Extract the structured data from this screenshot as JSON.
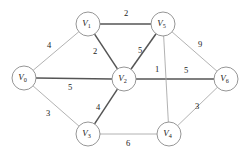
{
  "figure": {
    "background_color": "#ffffff",
    "edge_color": "#a9a9a9",
    "edge_highlight_color": "#555555",
    "node_fill": "#ffffff",
    "node_stroke": "#8a8a8a",
    "text_color": "#1a1a1a"
  },
  "chart_data": {
    "type": "diagram",
    "subtype": "weighted-undirected-graph",
    "title": "",
    "nodes": [
      {
        "id": "V0",
        "label": "V",
        "sub": "0",
        "x": 24,
        "y": 78
      },
      {
        "id": "V1",
        "label": "V",
        "sub": "1",
        "x": 88,
        "y": 24
      },
      {
        "id": "V5",
        "label": "V",
        "sub": "5",
        "x": 163,
        "y": 24
      },
      {
        "id": "V2",
        "label": "V",
        "sub": "2",
        "x": 124,
        "y": 79
      },
      {
        "id": "V6",
        "label": "V",
        "sub": "6",
        "x": 226,
        "y": 79
      },
      {
        "id": "V3",
        "label": "V",
        "sub": "3",
        "x": 88,
        "y": 134
      },
      {
        "id": "V4",
        "label": "V",
        "sub": "4",
        "x": 169,
        "y": 134
      }
    ],
    "node_radius": 12,
    "edges": [
      {
        "from": "V0",
        "to": "V1",
        "weight": "4",
        "lx": 49,
        "ly": 46,
        "bold": false
      },
      {
        "from": "V1",
        "to": "V5",
        "weight": "2",
        "lx": 126,
        "ly": 14,
        "bold": true
      },
      {
        "from": "V1",
        "to": "V2",
        "weight": "2",
        "lx": 95,
        "ly": 52,
        "bold": true
      },
      {
        "from": "V2",
        "to": "V5",
        "weight": "5",
        "lx": 140,
        "ly": 51,
        "bold": true
      },
      {
        "from": "V5",
        "to": "V6",
        "weight": "9",
        "lx": 200,
        "ly": 45,
        "bold": false
      },
      {
        "from": "V0",
        "to": "V2",
        "weight": "5",
        "lx": 70,
        "ly": 88,
        "bold": true
      },
      {
        "from": "V2",
        "to": "V6",
        "weight": "5",
        "lx": 186,
        "ly": 71,
        "bold": true
      },
      {
        "from": "V5",
        "to": "V4",
        "weight": "1",
        "lx": 157,
        "ly": 70,
        "bold": false
      },
      {
        "from": "V0",
        "to": "V3",
        "weight": "3",
        "lx": 48,
        "ly": 114,
        "bold": false
      },
      {
        "from": "V2",
        "to": "V3",
        "weight": "4",
        "lx": 98,
        "ly": 108,
        "bold": true
      },
      {
        "from": "V3",
        "to": "V4",
        "weight": "6",
        "lx": 128,
        "ly": 144,
        "bold": false
      },
      {
        "from": "V4",
        "to": "V6",
        "weight": "3",
        "lx": 197,
        "ly": 107,
        "bold": false
      }
    ],
    "legend": [],
    "xlabel": "",
    "ylabel": ""
  }
}
